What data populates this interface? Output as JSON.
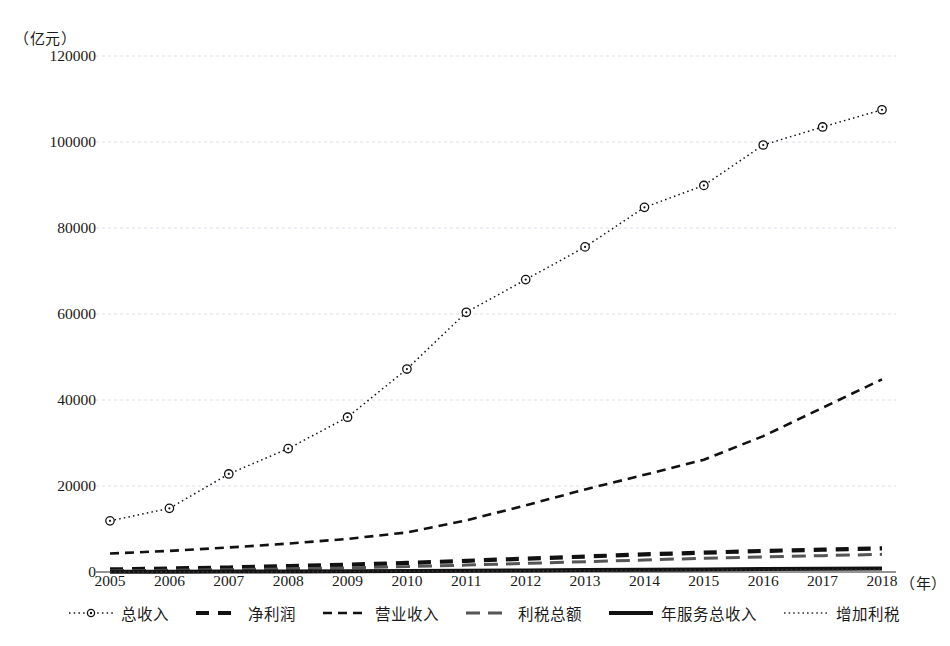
{
  "chart_data": {
    "type": "line",
    "title": "",
    "xlabel": "(年)",
    "ylabel": "(亿元)",
    "y_unit_label": "（亿元）",
    "x_unit_label": "（年）",
    "grid": true,
    "legend_position": "bottom",
    "xlim": [
      2005,
      2018
    ],
    "ylim": [
      0,
      120000
    ],
    "ytick_labels": [
      "0",
      "20000",
      "40000",
      "60000",
      "80000",
      "100000",
      "120000"
    ],
    "ytick_values": [
      0,
      20000,
      40000,
      60000,
      80000,
      100000,
      120000
    ],
    "categories": [
      "2005",
      "2006",
      "2007",
      "2008",
      "2009",
      "2010",
      "2011",
      "2012",
      "2013",
      "2014",
      "2015",
      "2016",
      "2017",
      "2018"
    ],
    "series": [
      {
        "name": "总收入",
        "style": "dotted-marker",
        "marker": "circle",
        "color": "#111111",
        "values": [
          11900,
          14800,
          22800,
          28700,
          36000,
          47200,
          60400,
          68000,
          75600,
          84800,
          89900,
          99300,
          103500,
          107500
        ]
      },
      {
        "name": "净利润",
        "style": "thick-dash",
        "color": "#111111",
        "values": [
          600,
          800,
          1050,
          1400,
          1700,
          2100,
          2600,
          3100,
          3600,
          4100,
          4500,
          4900,
          5200,
          5500
        ]
      },
      {
        "name": "营业收入",
        "style": "fine-dash",
        "color": "#111111",
        "values": [
          4300,
          4900,
          5700,
          6600,
          7700,
          9200,
          12000,
          15500,
          19200,
          22600,
          26100,
          31600,
          38200,
          44800
        ]
      },
      {
        "name": "利税总额",
        "style": "long-dash",
        "color": "#555555",
        "values": [
          300,
          400,
          550,
          750,
          950,
          1250,
          1600,
          2000,
          2400,
          2800,
          3200,
          3500,
          3800,
          4100
        ]
      },
      {
        "name": "年服务总收入",
        "style": "solid-thick",
        "color": "#111111",
        "values": [
          40,
          60,
          90,
          130,
          180,
          240,
          300,
          370,
          440,
          520,
          600,
          680,
          760,
          840
        ]
      },
      {
        "name": "增加利税",
        "style": "dotted",
        "color": "#333333",
        "values": [
          20,
          35,
          55,
          80,
          110,
          150,
          190,
          240,
          290,
          350,
          410,
          470,
          530,
          590
        ]
      }
    ]
  }
}
